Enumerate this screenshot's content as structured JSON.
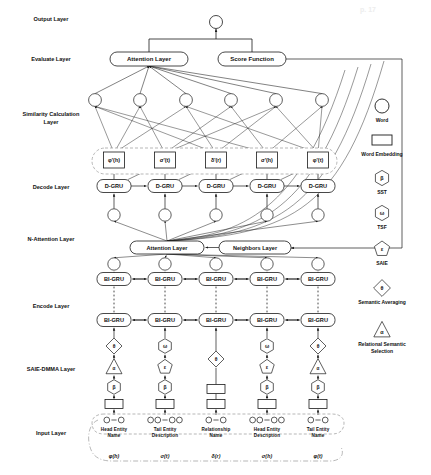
{
  "figure": {
    "caption": ""
  },
  "side_labels": [
    {
      "id": "output-layer",
      "text": "Output Layer",
      "x": 8,
      "y": 16
    },
    {
      "id": "evaluate-layer",
      "text": "Evaluate Layer",
      "x": 8,
      "y": 56
    },
    {
      "id": "similarity-layer",
      "text": "Similarity Calculation\nLayer",
      "x": 8,
      "y": 111
    },
    {
      "id": "decode-layer",
      "text": "Decode Layer",
      "x": 8,
      "y": 184
    },
    {
      "id": "nattention-layer",
      "text": "N-Attention Layer",
      "x": 8,
      "y": 236
    },
    {
      "id": "encode-layer",
      "text": "Encode Layer",
      "x": 8,
      "y": 303
    },
    {
      "id": "saie-dmma-layer",
      "text": "SAIE-DMMA Layer",
      "x": 8,
      "y": 366
    },
    {
      "id": "input-layer",
      "text": "Input Layer",
      "x": 8,
      "y": 430
    }
  ],
  "nodes": {
    "output_sum": "+",
    "evaluate_attention": "Attention Layer",
    "score_function": "Score Function",
    "n_attention": "Attention Layer",
    "neighbors_layer": "Neighbors Layer",
    "decode_cell": "D-GRU",
    "encode_cell": "BI-GRU",
    "dots": "⋮"
  },
  "columns": [
    {
      "index": 0,
      "x": 114,
      "decode_token": "φ'(h)",
      "input_title": "Head Entity\nName",
      "input_formula": "φ(h)",
      "saie_stack": [
        "theta-diamond",
        "alpha-triangle",
        "beta-hex"
      ],
      "word_count": 3
    },
    {
      "index": 1,
      "x": 165,
      "decode_token": "σ'(t)",
      "input_title": "Tail Entity\nDescription",
      "input_formula": "σ(t)",
      "saie_stack": [
        "omega-hex",
        "epsilon-pent",
        "beta-hex"
      ],
      "word_count": 5
    },
    {
      "index": 2,
      "x": 216,
      "decode_token": "δ'(r)",
      "input_title": "Relationship\nName",
      "input_formula": "δ(r)",
      "saie_stack": [
        "theta-diamond",
        "embedding-box"
      ],
      "word_count": 3
    },
    {
      "index": 3,
      "x": 267,
      "decode_token": "σ'(h)",
      "input_title": "Head Entity\nDescription",
      "input_formula": "σ(h)",
      "saie_stack": [
        "omega-hex",
        "epsilon-pent",
        "beta-hex"
      ],
      "word_count": 5
    },
    {
      "index": 4,
      "x": 318,
      "decode_token": "φ'(t)",
      "input_title": "Tail Entity\nName",
      "input_formula": "φ(t)",
      "saie_stack": [
        "theta-diamond",
        "alpha-triangle",
        "beta-hex"
      ],
      "word_count": 3
    }
  ],
  "similarity_circles_x": [
    95,
    140,
    186,
    231,
    276,
    322
  ],
  "legend": {
    "title": "",
    "items": [
      {
        "id": "word",
        "glyph": "circle",
        "symbol": "",
        "label": "Word"
      },
      {
        "id": "word-embedding",
        "glyph": "rect",
        "symbol": "",
        "label": "Word Embedding"
      },
      {
        "id": "sst",
        "glyph": "hexagon",
        "symbol": "β",
        "label": "SST"
      },
      {
        "id": "tsf",
        "glyph": "hexagon",
        "symbol": "ω",
        "label": "TSF"
      },
      {
        "id": "saie",
        "glyph": "pentagon",
        "symbol": "ε",
        "label": "SAIE"
      },
      {
        "id": "semantic-averaging",
        "glyph": "diamond",
        "symbol": "θ",
        "label": "Semantic Averaging"
      },
      {
        "id": "relational-semantic-selection",
        "glyph": "triangle",
        "symbol": "α",
        "label": "Relational Semantic\nSelection"
      }
    ]
  },
  "colors": {
    "stroke": "#1a1a1a",
    "dashed": "#9a9a9a",
    "background": "#ffffff",
    "faint_text": "#e8e8e8"
  }
}
